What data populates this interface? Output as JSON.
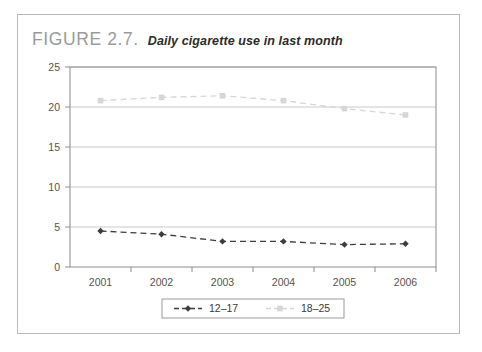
{
  "figure": {
    "label": "FIGURE 2.7.",
    "caption": "Daily cigarette use in last month"
  },
  "chart_data": {
    "type": "line",
    "title": "Daily cigarette use in last month",
    "xlabel": "",
    "ylabel": "",
    "categories": [
      "2001",
      "2002",
      "2003",
      "2004",
      "2005",
      "2006"
    ],
    "series": [
      {
        "name": "12–17",
        "values": [
          4.5,
          4.1,
          3.2,
          3.2,
          2.8,
          2.9
        ],
        "color": "#3d3d3d",
        "marker": "diamond",
        "dash": "dashed"
      },
      {
        "name": "18–25",
        "values": [
          20.8,
          21.2,
          21.4,
          20.8,
          19.8,
          19.0
        ],
        "color": "#d6d6d6",
        "marker": "square",
        "dash": "dashed"
      }
    ],
    "ylim": [
      0,
      25
    ],
    "yticks": [
      0,
      5,
      10,
      15,
      20,
      25
    ],
    "ytick_labels": [
      "0",
      "5",
      "10",
      "15",
      "20",
      "25"
    ],
    "grid": true,
    "legend_position": "bottom"
  },
  "legend": {
    "items": [
      {
        "label": "12–17"
      },
      {
        "label": "18–25"
      }
    ]
  },
  "axis": {
    "y_labels": [
      "25",
      "20",
      "15",
      "10",
      "5",
      "0"
    ],
    "x_labels": [
      "2001",
      "2002",
      "2003",
      "2004",
      "2005",
      "2006"
    ]
  }
}
